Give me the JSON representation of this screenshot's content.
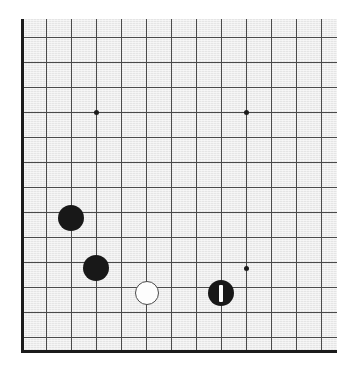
{
  "board": {
    "title": "Go board diagram",
    "background_color": "#ebebeb",
    "line_color": "#4a4a4a",
    "edge_color": "#1b1b1b",
    "black_stone_color": "#181818",
    "white_stone_color": "#fdfdfd",
    "marker_color": "#fdfdfd",
    "grid_spacing_px": 25,
    "origin_x_px": 21,
    "origin_y_px": 37,
    "surface": {
      "left": 21,
      "top": 19,
      "width": 316,
      "height": 334
    },
    "edges": {
      "left": {
        "x": 21,
        "y_top": 19,
        "y_bottom": 353
      },
      "bottom": {
        "y": 350,
        "x_left": 21,
        "x_right": 337
      }
    },
    "vertical_lines_x": [
      21,
      46,
      71,
      96,
      121,
      146,
      171,
      196,
      221,
      246,
      271,
      296,
      321
    ],
    "horizontal_lines_y": [
      37,
      62,
      87,
      112,
      137,
      162,
      187,
      212,
      237,
      262,
      287,
      312,
      337
    ],
    "star_points": [
      {
        "name": "hoshi-upper-left",
        "x": 96,
        "y": 112
      },
      {
        "name": "hoshi-upper-right",
        "x": 246,
        "y": 112
      },
      {
        "name": "hoshi-lower-right",
        "x": 246,
        "y": 268
      }
    ],
    "stones": [
      {
        "name": "black-stone-1",
        "color": "black",
        "x": 71,
        "y": 218,
        "radius": 13,
        "marked": false
      },
      {
        "name": "black-stone-2",
        "color": "black",
        "x": 96,
        "y": 268,
        "radius": 13,
        "marked": false
      },
      {
        "name": "white-stone-1",
        "color": "white",
        "x": 147,
        "y": 293,
        "radius": 12,
        "marked": false
      },
      {
        "name": "black-stone-last-move",
        "color": "black",
        "x": 221,
        "y": 293,
        "radius": 13,
        "marked": true,
        "marker": "vertical-bar"
      }
    ],
    "marker": {
      "type": "vertical-bar",
      "width": 4,
      "height": 17
    }
  }
}
